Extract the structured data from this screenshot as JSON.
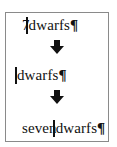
{
  "figure": {
    "steps": [
      {
        "before_cursor": "7",
        "cursor_overlaps_previous": true,
        "after_cursor": "dwarfs",
        "end_mark": "¶"
      },
      {
        "before_cursor": "",
        "cursor_overlaps_previous": false,
        "after_cursor": "dwarfs",
        "end_mark": "¶"
      },
      {
        "before_cursor": "seven",
        "cursor_overlaps_previous": true,
        "after_cursor": "dwarfs",
        "end_mark": "¶"
      }
    ],
    "arrows": [
      {
        "icon": "down-arrow-icon"
      },
      {
        "icon": "down-arrow-icon"
      }
    ],
    "colors": {
      "text": "#111111",
      "border": "#8a8a8a",
      "background": "#ffffff",
      "arrow": "#111111"
    }
  }
}
